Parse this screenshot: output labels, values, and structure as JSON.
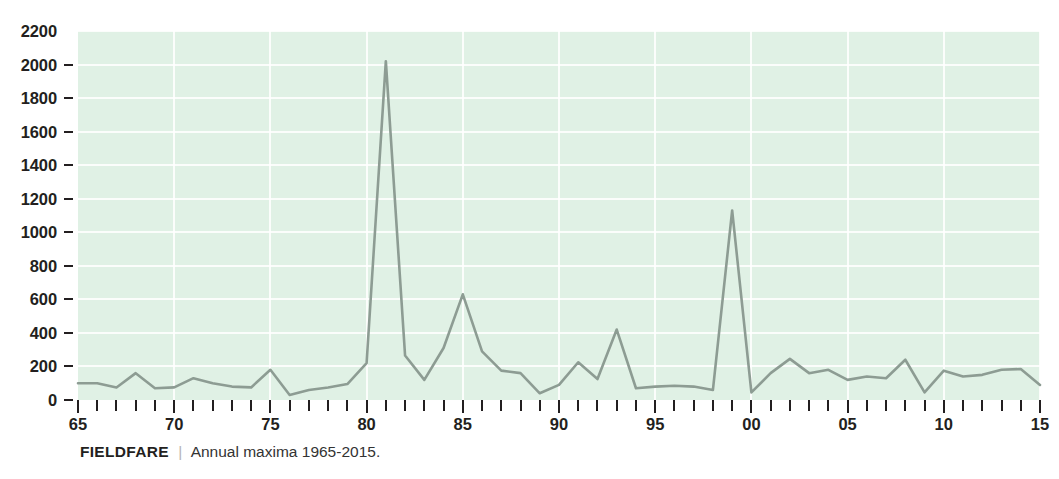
{
  "caption": {
    "species": "FIELDFARE",
    "separator": "|",
    "text": "Annual maxima 1965-2015."
  },
  "colors": {
    "plot_background": "#e0f1e5",
    "gridline": "#ffffff",
    "line": "#8d9c93",
    "text": "#231f20",
    "caption_text": "#333333",
    "page_background": "#ffffff"
  },
  "chart_data": {
    "type": "line",
    "title": "",
    "subtitle": "",
    "xlabel": "",
    "ylabel": "",
    "xlim": [
      1965,
      2015
    ],
    "ylim": [
      0,
      2200
    ],
    "grid": true,
    "legend": false,
    "y_ticks": [
      0,
      200,
      400,
      600,
      800,
      1000,
      1200,
      1400,
      1600,
      1800,
      2000,
      2200
    ],
    "y_tick_labels": [
      "0",
      "200",
      "400",
      "600",
      "800",
      "1000",
      "1200",
      "1400",
      "1600",
      "1800",
      "2000",
      "2200"
    ],
    "x_major_ticks": [
      1965,
      1970,
      1975,
      1980,
      1985,
      1990,
      1995,
      2000,
      2005,
      2010,
      2015
    ],
    "x_major_tick_labels": [
      "65",
      "70",
      "75",
      "80",
      "85",
      "90",
      "95",
      "00",
      "05",
      "10",
      "15"
    ],
    "x_minor_tick_step": 1,
    "series": [
      {
        "name": "Annual maxima",
        "color": "#8d9c93",
        "x": [
          1965,
          1966,
          1967,
          1968,
          1969,
          1970,
          1971,
          1972,
          1973,
          1974,
          1975,
          1976,
          1977,
          1978,
          1979,
          1980,
          1981,
          1982,
          1983,
          1984,
          1985,
          1986,
          1987,
          1988,
          1989,
          1990,
          1991,
          1992,
          1993,
          1994,
          1995,
          1996,
          1997,
          1998,
          1999,
          2000,
          2001,
          2002,
          2003,
          2004,
          2005,
          2006,
          2007,
          2008,
          2009,
          2010,
          2011,
          2012,
          2013,
          2014,
          2015
        ],
        "values": [
          100,
          100,
          75,
          160,
          70,
          75,
          130,
          100,
          80,
          75,
          180,
          30,
          60,
          75,
          95,
          220,
          2020,
          265,
          120,
          310,
          630,
          290,
          175,
          160,
          40,
          90,
          225,
          125,
          420,
          70,
          80,
          85,
          80,
          60,
          1130,
          45,
          160,
          245,
          160,
          180,
          120,
          140,
          130,
          240,
          45,
          175,
          140,
          150,
          180,
          185,
          90
        ]
      }
    ]
  }
}
